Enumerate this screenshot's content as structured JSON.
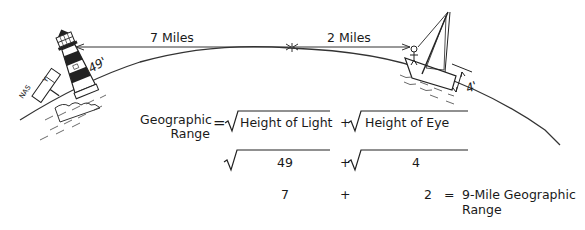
{
  "diagram": {
    "distance_labels": {
      "left": "7 Miles",
      "right": "2 Miles"
    },
    "heights": {
      "lighthouse": "49'",
      "eye": "4'"
    },
    "sign": {
      "left": "NAS",
      "right": "Y"
    },
    "formula": {
      "lhs_line1": "Geographic",
      "lhs_line2": "Range",
      "equals": "=",
      "term1": "Height of Light",
      "plus": "+",
      "term2": "Height of Eye",
      "row2": {
        "term1": "49",
        "plus": "+",
        "term2": "4"
      },
      "row3": {
        "term1": "7",
        "plus": "+",
        "term2": "2",
        "equals": "=",
        "result_line1": "9-Mile Geographic",
        "result_line2": "Range"
      }
    }
  }
}
